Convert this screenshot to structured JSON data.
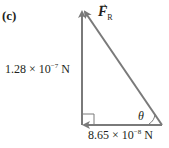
{
  "part_label": "(c)",
  "resultant": {
    "symbol": "F",
    "subscript": "R",
    "arrow": "→"
  },
  "vertical_vector": {
    "mantissa": "1.28 × 10",
    "exponent": "−7",
    "unit": " N"
  },
  "horizontal_vector": {
    "mantissa": "8.65 × 10",
    "exponent": "−8",
    "unit": " N"
  },
  "angle_label": "θ",
  "colors": {
    "vector": "#7a7a7a",
    "text": "#231f20"
  }
}
